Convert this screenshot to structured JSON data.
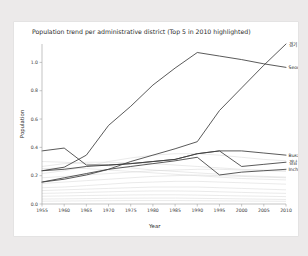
{
  "chart_data": {
    "type": "line",
    "title": "Population trend per administrative district (Top 5 in 2010 highlighted)",
    "xlabel": "Year",
    "ylabel": "Population",
    "grid": false,
    "legend_position": "inline-right-endpoint-labels",
    "xlim": [
      1955,
      2010
    ],
    "ylim": [
      0.0,
      1.13
    ],
    "x": [
      1955,
      1960,
      1965,
      1970,
      1975,
      1980,
      1985,
      1990,
      1995,
      2000,
      2005,
      2010
    ],
    "xticks": [
      "1955",
      "1960",
      "1965",
      "1970",
      "1975",
      "1980",
      "1985",
      "1990",
      "1995",
      "2000",
      "2005",
      "2010"
    ],
    "yticks": [
      "0.0",
      "0.2",
      "0.4",
      "0.6",
      "0.8",
      "1.0"
    ],
    "highlighted_series": [
      {
        "name": "경기",
        "label": "경기",
        "label_x": 2010,
        "label_y": 1.13,
        "values": [
          0.155,
          0.175,
          0.205,
          0.245,
          0.3,
          0.345,
          0.39,
          0.44,
          0.66,
          0.82,
          0.98,
          1.13
        ]
      },
      {
        "name": "Seoul",
        "label": "Seoul",
        "label_x": 2010,
        "label_y": 0.965,
        "values": [
          0.235,
          0.26,
          0.345,
          0.555,
          0.69,
          0.84,
          0.96,
          1.07,
          1.045,
          1.02,
          0.99,
          0.965
        ]
      },
      {
        "name": "Busan",
        "label": "Busan",
        "label_x": 2010,
        "label_y": 0.345,
        "values": [
          0.375,
          0.395,
          0.275,
          0.275,
          0.285,
          0.3,
          0.315,
          0.355,
          0.375,
          0.375,
          0.36,
          0.345
        ]
      },
      {
        "name": "경남",
        "label": "경남",
        "label_x": 2010,
        "label_y": 0.295,
        "values": [
          0.235,
          0.245,
          0.265,
          0.275,
          0.285,
          0.3,
          0.315,
          0.355,
          0.375,
          0.265,
          0.28,
          0.295
        ]
      },
      {
        "name": "Incheon",
        "label": "Incheon",
        "label_x": 2010,
        "label_y": 0.245,
        "values": [
          0.155,
          0.185,
          0.215,
          0.245,
          0.265,
          0.285,
          0.305,
          0.33,
          0.205,
          0.225,
          0.235,
          0.245
        ]
      }
    ],
    "background_series": [
      {
        "name": "bg-1",
        "values": [
          0.215,
          0.235,
          0.265,
          0.3,
          0.325,
          0.345,
          0.355,
          0.355,
          0.345,
          0.33,
          0.315,
          0.305
        ]
      },
      {
        "name": "bg-2",
        "values": [
          0.265,
          0.285,
          0.295,
          0.295,
          0.29,
          0.285,
          0.275,
          0.265,
          0.255,
          0.245,
          0.24,
          0.235
        ]
      },
      {
        "name": "bg-3",
        "values": [
          0.185,
          0.195,
          0.205,
          0.215,
          0.225,
          0.235,
          0.24,
          0.245,
          0.245,
          0.24,
          0.235,
          0.23
        ]
      },
      {
        "name": "bg-4",
        "values": [
          0.145,
          0.155,
          0.165,
          0.175,
          0.185,
          0.195,
          0.2,
          0.205,
          0.2,
          0.195,
          0.19,
          0.185
        ]
      },
      {
        "name": "bg-5",
        "values": [
          0.115,
          0.12,
          0.13,
          0.14,
          0.15,
          0.155,
          0.16,
          0.16,
          0.155,
          0.15,
          0.145,
          0.14
        ]
      },
      {
        "name": "bg-6",
        "values": [
          0.095,
          0.1,
          0.105,
          0.11,
          0.115,
          0.12,
          0.12,
          0.12,
          0.115,
          0.11,
          0.105,
          0.1
        ]
      },
      {
        "name": "bg-7",
        "values": [
          0.075,
          0.078,
          0.082,
          0.086,
          0.09,
          0.092,
          0.092,
          0.09,
          0.086,
          0.082,
          0.078,
          0.075
        ]
      },
      {
        "name": "bg-8",
        "values": [
          0.055,
          0.057,
          0.06,
          0.062,
          0.064,
          0.065,
          0.065,
          0.063,
          0.06,
          0.057,
          0.055,
          0.052
        ]
      },
      {
        "name": "bg-9",
        "values": [
          0.035,
          0.036,
          0.038,
          0.04,
          0.041,
          0.042,
          0.042,
          0.04,
          0.038,
          0.036,
          0.034,
          0.032
        ]
      },
      {
        "name": "bg-10",
        "values": [
          0.02,
          0.021,
          0.022,
          0.023,
          0.024,
          0.024,
          0.024,
          0.023,
          0.022,
          0.021,
          0.02,
          0.019
        ]
      },
      {
        "name": "bg-11",
        "values": [
          0.25,
          0.255,
          0.25,
          0.24,
          0.23,
          0.22,
          0.21,
          0.2,
          0.19,
          0.18,
          0.175,
          0.17
        ]
      },
      {
        "name": "bg-12",
        "values": [
          0.3,
          0.295,
          0.285,
          0.27,
          0.255,
          0.24,
          0.23,
          0.22,
          0.21,
          0.2,
          0.195,
          0.19
        ]
      }
    ]
  },
  "colors": {
    "page_background": "#eceaea",
    "figure_background": "#ffffff",
    "highlight_line": "#3c3c3c",
    "background_line": "#d8d8d8",
    "axis": "#9a9a9a",
    "text": "#2b2b2b"
  }
}
